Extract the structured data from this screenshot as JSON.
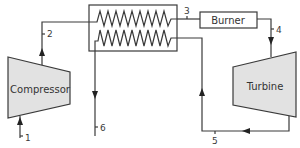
{
  "diagram": {
    "type": "gas turbine cycle with regenerator (heat exchanger)",
    "colors": {
      "line": "#3a3a3a",
      "component_fill": "#e2e2e2",
      "background": "#ffffff"
    },
    "components": {
      "compressor": {
        "label": "Compressor"
      },
      "turbine": {
        "label": "Turbine"
      },
      "burner": {
        "label": "Burner"
      },
      "heat_exchanger": {
        "label": ""
      }
    },
    "states": {
      "s1": "1",
      "s2": "2",
      "s3": "3",
      "s4": "4",
      "s5": "5",
      "s6": "6"
    },
    "flows": [
      {
        "from": "inlet",
        "to": "compressor",
        "state": "1"
      },
      {
        "from": "compressor",
        "to": "heat_exchanger",
        "state": "2"
      },
      {
        "from": "heat_exchanger",
        "to": "burner",
        "state": "3"
      },
      {
        "from": "burner",
        "to": "turbine",
        "state": "4"
      },
      {
        "from": "turbine",
        "to": "heat_exchanger",
        "state": "5"
      },
      {
        "from": "heat_exchanger",
        "to": "exhaust",
        "state": "6"
      }
    ]
  }
}
